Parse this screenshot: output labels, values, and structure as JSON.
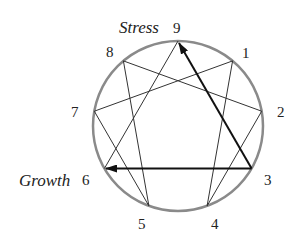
{
  "diagram": {
    "type": "enneagram",
    "center": [
      178,
      126
    ],
    "radius": 85,
    "colors": {
      "circle": "#8a8a8a",
      "lines": "#333333",
      "arrows": "#111111"
    },
    "points": [
      {
        "id": "9",
        "label": "9"
      },
      {
        "id": "1",
        "label": "1"
      },
      {
        "id": "2",
        "label": "2"
      },
      {
        "id": "3",
        "label": "3"
      },
      {
        "id": "4",
        "label": "4"
      },
      {
        "id": "5",
        "label": "5"
      },
      {
        "id": "6",
        "label": "6"
      },
      {
        "id": "7",
        "label": "7"
      },
      {
        "id": "8",
        "label": "8"
      }
    ],
    "triangle": [
      "9",
      "3",
      "6"
    ],
    "hexad": [
      "1",
      "4",
      "2",
      "8",
      "5",
      "7"
    ],
    "arrows": [
      {
        "from": "3",
        "to": "9",
        "meaning": "Stress"
      },
      {
        "from": "3",
        "to": "6",
        "meaning": "Growth"
      }
    ],
    "annotations": {
      "stress": "Stress",
      "growth": "Growth"
    }
  }
}
